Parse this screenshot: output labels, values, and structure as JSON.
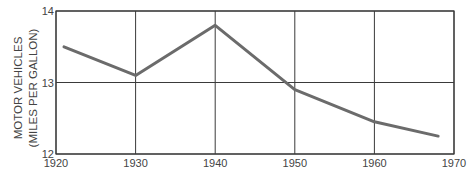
{
  "chart_data": {
    "type": "line",
    "title": "",
    "xlabel": "",
    "ylabel": [
      "MOTOR VEHICLES",
      "(MILES PER GALLON)"
    ],
    "x": [
      1921,
      1930,
      1940,
      1950,
      1960,
      1968
    ],
    "series": [
      {
        "name": "Motor vehicles fuel economy",
        "values": [
          13.5,
          13.1,
          13.8,
          12.9,
          12.45,
          12.25
        ]
      }
    ],
    "xticks": [
      1920,
      1930,
      1940,
      1950,
      1960,
      1970
    ],
    "yticks": [
      12,
      13,
      14
    ],
    "xlim": [
      1920,
      1970
    ],
    "ylim": [
      12,
      14
    ],
    "grid": true,
    "legend": "none",
    "colors": {
      "line": "#6b6b6b",
      "grid": "#3a3a3a",
      "text": "#444444"
    }
  }
}
